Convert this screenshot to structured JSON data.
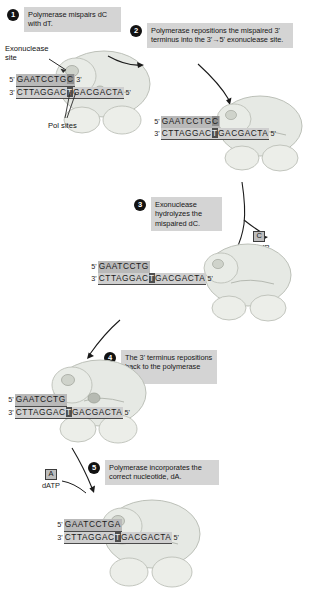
{
  "steps": [
    {
      "num": "1",
      "text": "Polymerase mispairs dC with dT."
    },
    {
      "num": "2",
      "text": "Polymerase repositions the mispaired 3' terminus into the 3'→5' exonuclease site."
    },
    {
      "num": "3",
      "text": "Exonuclease hydrolyzes the mispaired dC."
    },
    {
      "num": "4",
      "text": "The 3' terminus repositions back to the polymerase site."
    },
    {
      "num": "5",
      "text": "Polymerase incorporates the correct nucleotide, dA."
    }
  ],
  "labels": {
    "exonuclease_site": "Exonuclease\nsite",
    "exonuclease_site_line1": "Exonuclease",
    "exonuclease_site_line2": "site",
    "pol_sites": "Pol sites"
  },
  "nucleotides": [
    {
      "base": "C",
      "name": "dCMP"
    },
    {
      "base": "A",
      "name": "dATP"
    }
  ],
  "duplexes": [
    {
      "id": "duplex-1",
      "top_label_5": "5'",
      "top_label_3": "3'",
      "bot_label_3": "3'",
      "bot_label_5": "5'",
      "top_seq": "GAATCCTG",
      "top_terminal": "C",
      "bot_seq_a": "CTTAGGAC",
      "bot_template": "T",
      "bot_seq_b": "GACGACTA"
    },
    {
      "id": "duplex-2",
      "top_label_5": "5'",
      "top_label_3": "",
      "bot_label_3": "3'",
      "bot_label_5": "5'",
      "top_seq": "GAATCCTG",
      "top_terminal": "C",
      "bot_seq_a": "CTTAGGAC",
      "bot_template": "T",
      "bot_seq_b": "GACGACTA"
    },
    {
      "id": "duplex-3",
      "top_label_5": "5'",
      "top_label_3": "",
      "bot_label_3": "3'",
      "bot_label_5": "5'",
      "top_seq": "GAATCCTG",
      "top_terminal": "",
      "bot_seq_a": "CTTAGGAC",
      "bot_template": "T",
      "bot_seq_b": "GACGACTA"
    },
    {
      "id": "duplex-4",
      "top_label_5": "5'",
      "top_label_3": "",
      "bot_label_3": "3'",
      "bot_label_5": "5'",
      "top_seq": "GAATCCTG",
      "top_terminal": "",
      "bot_seq_a": "CTTAGGAC",
      "bot_template": "T",
      "bot_seq_b": "GACGACTA"
    },
    {
      "id": "duplex-5",
      "top_label_5": "5'",
      "top_label_3": "",
      "bot_label_3": "3'",
      "bot_label_5": "5'",
      "top_seq": "GAATCCTG",
      "top_terminal": "A",
      "bot_seq_a": "CTTAGGAC",
      "bot_template": "T",
      "bot_seq_b": "GACGACTA"
    }
  ],
  "colors": {
    "callout_bg": "#d4d4d4",
    "step_circle": "#121212",
    "strand_top_highlight": "#b9b9b9",
    "strand_bottom_highlight": "#cfcfcf",
    "template_base": "#4e4e4e",
    "enzyme_fill": "#e3e6e1",
    "enzyme_stroke": "#b9bdb6",
    "page_bg": "#ffffff"
  }
}
